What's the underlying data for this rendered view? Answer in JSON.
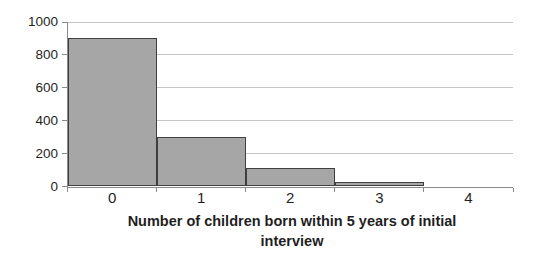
{
  "chart_data": {
    "type": "bar",
    "subtype": "histogram",
    "categories": [
      "0",
      "1",
      "2",
      "3",
      "4"
    ],
    "values": [
      900,
      300,
      110,
      30,
      0
    ],
    "title": "",
    "xlabel": "Number of children born within 5 years of initial interview",
    "ylabel": "",
    "ylim": [
      0,
      1000
    ],
    "yticks": [
      0,
      200,
      400,
      600,
      800,
      1000
    ],
    "grid": "horizontal",
    "legend": "none",
    "gap_width_percent": 0,
    "colors": {
      "bar_fill": "#a6a6a6",
      "bar_border": "#3f3f3f",
      "gridline": "#c6c6c6",
      "axis": "#8a8a8a",
      "text": "#1f1f1f",
      "background": "#ffffff"
    }
  }
}
